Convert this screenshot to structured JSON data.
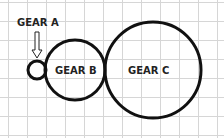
{
  "diagram": {
    "title": "",
    "background": "#ffffff",
    "grid": {
      "visible": true,
      "cell_size": 19,
      "color": "#d6d6d6",
      "vertical_x": [
        8,
        27,
        46,
        65,
        84,
        103,
        122,
        141,
        160,
        179,
        198,
        217
      ],
      "horizontal_y": [
        2,
        21,
        40,
        59,
        78,
        97,
        116,
        135
      ]
    },
    "gears": [
      {
        "id": "gear-a",
        "label": "GEAR A",
        "cx": 37,
        "cy": 70,
        "r": 9,
        "label_position": "above-with-arrow"
      },
      {
        "id": "gear-b",
        "label": "GEAR B",
        "cx": 75,
        "cy": 70,
        "r": 30,
        "label_position": "inside"
      },
      {
        "id": "gear-c",
        "label": "GEAR C",
        "cx": 153,
        "cy": 70,
        "r": 48,
        "label_position": "inside"
      }
    ],
    "labels": {
      "gear_a": "GEAR A",
      "gear_b": "GEAR B",
      "gear_c": "GEAR C"
    },
    "arrow": {
      "points_to": "gear-a",
      "direction": "down"
    },
    "stroke_color": "#111111"
  }
}
